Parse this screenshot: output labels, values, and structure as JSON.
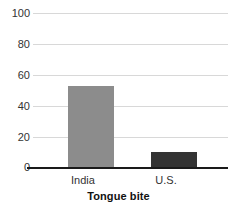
{
  "chart_data": {
    "type": "bar",
    "title": "",
    "xlabel": "Tongue bite",
    "ylabel": "",
    "categories": [
      "India",
      "U.S."
    ],
    "values": [
      53,
      10
    ],
    "series": [
      {
        "name": "Tongue bite",
        "values": [
          53,
          10
        ]
      }
    ],
    "ylim": [
      0,
      100
    ],
    "ytick_labels": [
      "0",
      "20",
      "40",
      "60",
      "80",
      "100"
    ],
    "ytick_values": [
      0,
      20,
      40,
      60,
      80,
      100
    ],
    "grid": true,
    "legend": "none",
    "bar_colors": [
      "#8c8c8c",
      "#333333"
    ],
    "gridline_color": "#d8d8d8",
    "axis_color": "#1a1a1a"
  },
  "axis": {
    "y_labels": {
      "t100": "100",
      "t80": "80",
      "t60": "60",
      "t40": "40",
      "t20": "20",
      "t0": "0"
    },
    "x_labels": {
      "c0": "India",
      "c1": "U.S."
    },
    "x_title": "Tongue bite"
  }
}
